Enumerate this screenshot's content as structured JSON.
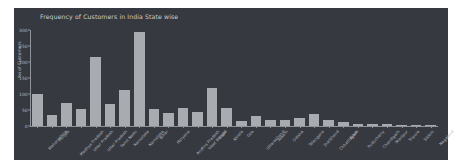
{
  "figure": {
    "background_color": "#36393f",
    "page_background_color": "#ffffff",
    "bar_color": "#a8abb0",
    "text_color": "#b6bac0",
    "axis_color": "#8f949b"
  },
  "chart_data": {
    "type": "bar",
    "title": "Frequency of Customers in India State wise",
    "xlabel": "",
    "ylabel": "No of Customers",
    "ylim": [
      0,
      300
    ],
    "yticks": [
      0,
      50,
      100,
      150,
      200,
      250,
      300
    ],
    "ytick_labels": [
      "0",
      "50",
      "100",
      "150",
      "200",
      "250",
      "300"
    ],
    "grid": false,
    "legend": false,
    "orientation": "vertical",
    "xtick_rotation": -47,
    "categories": [
      "Maharashtra",
      "Punjab",
      "Madhya Pradesh",
      "Uttar Pradesh",
      "Uttar Pradesh",
      "Tamil Nadu",
      "Karnataka",
      "Karnataka",
      "Bihar",
      "Haryana",
      "Andhra Pradesh",
      "West Bengal",
      "Delhi",
      "Kerala",
      "Goa",
      "Uttarakhand",
      "Assam",
      "Odisha",
      "Telangana",
      "Jharkhand",
      "Chhattisgarh",
      "Bihar",
      "Puducherry",
      "Chandigarh",
      "Manipur",
      "Tripura",
      "Sikkim",
      "Nagaland"
    ],
    "values": [
      100,
      35,
      72,
      52,
      215,
      68,
      113,
      295,
      52,
      42,
      55,
      45,
      120,
      55,
      15,
      30,
      18,
      18,
      25,
      38,
      20,
      12,
      6,
      5,
      5,
      4,
      3,
      3
    ]
  }
}
